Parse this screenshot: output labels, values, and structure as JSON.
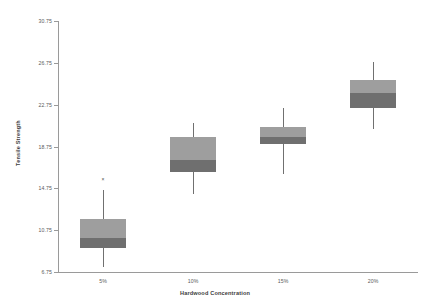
{
  "chart_data": {
    "type": "box",
    "title": "",
    "xlabel": "Hardwood Concentration",
    "ylabel": "Tensile Strength",
    "grid": false,
    "legend": "none",
    "ylim": [
      6.75,
      30.75
    ],
    "yticks": [
      "6.75",
      "10.75",
      "14.75",
      "18.75",
      "22.75",
      "26.75",
      "30.75"
    ],
    "ytick_values": [
      6.75,
      10.75,
      14.75,
      18.75,
      22.75,
      26.75,
      30.75
    ],
    "categories": [
      "5%",
      "10%",
      "15%",
      "20%"
    ],
    "boxes": [
      {
        "category": "5%",
        "whisker_low": 7.2,
        "q1": 9.0,
        "median": 10.0,
        "q3": 11.8,
        "whisker_high": 14.6,
        "outliers": [
          15.6
        ]
      },
      {
        "category": "10%",
        "whisker_low": 14.2,
        "q1": 16.3,
        "median": 17.5,
        "q3": 19.7,
        "whisker_high": 21.0,
        "outliers": []
      },
      {
        "category": "15%",
        "whisker_low": 16.1,
        "q1": 19.0,
        "median": 19.7,
        "q3": 20.6,
        "whisker_high": 22.4,
        "outliers": []
      },
      {
        "category": "20%",
        "whisker_low": 20.4,
        "q1": 22.4,
        "median": 23.9,
        "q3": 25.1,
        "whisker_high": 26.8,
        "outliers": []
      }
    ],
    "colors": {
      "box_upper": "#9e9e9e",
      "box_lower": "#6f6f6f",
      "whisker": "#707070",
      "axis": "#9a9a9a",
      "tick_text": "#5a5a5a",
      "title_text": "#3c3c3c",
      "background": "#ffffff"
    },
    "outlier_marker": "×"
  }
}
